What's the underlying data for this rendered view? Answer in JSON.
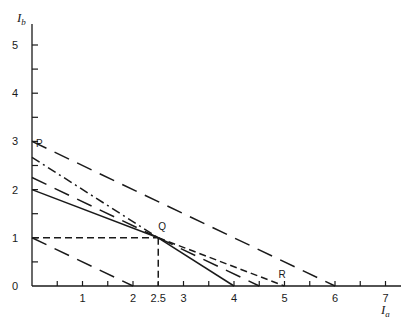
{
  "chart_data": {
    "type": "line",
    "title": "",
    "xlabel": "I",
    "xlabel_sub": "a",
    "ylabel": "I",
    "ylabel_sub": "b",
    "xlim": [
      0,
      7.3
    ],
    "ylim": [
      0,
      5.5
    ],
    "grid": false,
    "x_ticks": [
      0.5,
      1,
      1.5,
      2,
      2.5,
      3,
      3.5,
      4,
      4.5,
      5,
      5.5,
      6,
      6.5,
      7
    ],
    "x_tick_labels": [
      {
        "value": 1,
        "label": "1"
      },
      {
        "value": 2,
        "label": "2"
      },
      {
        "value": 2.5,
        "label": "2.5"
      },
      {
        "value": 3,
        "label": "3"
      },
      {
        "value": 4,
        "label": "4"
      },
      {
        "value": 5,
        "label": "5"
      },
      {
        "value": 6,
        "label": "6"
      },
      {
        "value": 7,
        "label": "7"
      }
    ],
    "y_ticks": [
      0.5,
      1,
      1.5,
      2,
      2.5,
      3,
      3.5,
      4,
      4.5,
      5
    ],
    "y_tick_labels": [
      {
        "value": 0,
        "label": "0"
      },
      {
        "value": 1,
        "label": "1"
      },
      {
        "value": 2,
        "label": "2"
      },
      {
        "value": 3,
        "label": "3"
      },
      {
        "value": 4,
        "label": "4"
      },
      {
        "value": 5,
        "label": "5"
      }
    ],
    "series": [
      {
        "name": "outer-budget-line",
        "style": "long-dash",
        "points": [
          [
            0,
            3
          ],
          [
            6,
            0
          ]
        ]
      },
      {
        "name": "inner-budget-line",
        "style": "long-dash",
        "points": [
          [
            0,
            1
          ],
          [
            2,
            0
          ]
        ]
      },
      {
        "name": "line-P-left",
        "style": "dash-dot",
        "points": [
          [
            0,
            2.67
          ],
          [
            2.5,
            1
          ]
        ]
      },
      {
        "name": "line-P-right",
        "style": "solid",
        "points": [
          [
            2.5,
            1
          ],
          [
            4,
            0
          ]
        ]
      },
      {
        "name": "line-mid-left",
        "style": "long-dash",
        "points": [
          [
            0,
            2.25
          ],
          [
            2.5,
            1
          ]
        ]
      },
      {
        "name": "line-mid-right",
        "style": "long-dash",
        "points": [
          [
            2.5,
            1
          ],
          [
            4.5,
            0
          ]
        ]
      },
      {
        "name": "line-R-left",
        "style": "solid",
        "points": [
          [
            0,
            2
          ],
          [
            2.5,
            1
          ]
        ]
      },
      {
        "name": "line-R-right",
        "style": "short-dash",
        "points": [
          [
            2.5,
            1
          ],
          [
            5,
            0
          ]
        ]
      },
      {
        "name": "q-horizontal-guide",
        "style": "short-dash",
        "points": [
          [
            0,
            1
          ],
          [
            2.5,
            1
          ]
        ]
      },
      {
        "name": "q-vertical-guide",
        "style": "short-dash",
        "points": [
          [
            2.5,
            1
          ],
          [
            2.5,
            0
          ]
        ]
      }
    ],
    "annotations": [
      {
        "label": "P",
        "x": 0,
        "y": 2.67
      },
      {
        "label": "Q",
        "x": 2.5,
        "y": 1
      },
      {
        "label": "R",
        "x": 5,
        "y": 0
      }
    ]
  }
}
